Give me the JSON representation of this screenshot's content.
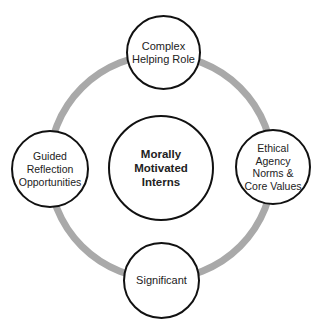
{
  "diagram": {
    "ring_color": "#a9a9a9",
    "border_color": "#111111",
    "center": {
      "label": "Morally\nMotivated\nInterns"
    },
    "nodes": [
      {
        "id": "top",
        "label": "Complex\nHelping Role"
      },
      {
        "id": "right",
        "label": "Ethical\nAgency\nNorms &\nCore Values"
      },
      {
        "id": "bottom",
        "label": "Significant"
      },
      {
        "id": "left",
        "label": "Guided\nReflection\nOpportunities"
      }
    ]
  }
}
